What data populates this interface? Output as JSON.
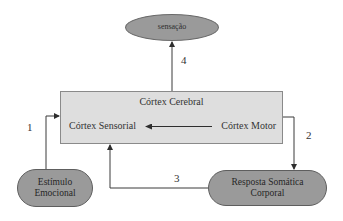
{
  "diagram": {
    "type": "flow",
    "nodes": {
      "sensacao": {
        "label": "sensação",
        "shape": "ellipse"
      },
      "cortex_cerebral": {
        "title": "Córtex Cerebral",
        "shape": "rectangle",
        "inner": {
          "sensorial": "Córtex Sensorial",
          "motor": "Córtex Motor"
        }
      },
      "estimulo": {
        "line1": "Estímulo",
        "line2": "Emocional",
        "shape": "rounded-pill"
      },
      "resposta": {
        "line1": "Resposta Somática",
        "line2": "Corporal",
        "shape": "rounded-pill"
      }
    },
    "edges": [
      {
        "id": "1",
        "label": "1",
        "from": "Estímulo Emocional",
        "to": "Córtex Cerebral"
      },
      {
        "id": "2",
        "label": "2",
        "from": "Córtex Cerebral",
        "to": "Resposta Somática Corporal"
      },
      {
        "id": "3",
        "label": "3",
        "from": "Resposta Somática Corporal",
        "to": "Córtex Sensorial"
      },
      {
        "id": "4",
        "label": "4",
        "from": "Córtex Cerebral",
        "to": "sensação"
      },
      {
        "id": "inner",
        "label": "",
        "from": "Córtex Motor",
        "to": "Córtex Sensorial"
      }
    ],
    "colors": {
      "node_fill": "#9a9a9a",
      "box_fill": "#dedede",
      "line": "#3a3a3a"
    }
  }
}
